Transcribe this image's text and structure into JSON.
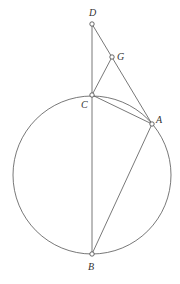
{
  "diagram": {
    "type": "geometry",
    "circle": {
      "cx": 92,
      "cy": 175,
      "r": 79
    },
    "points": [
      {
        "id": "D",
        "label": "D",
        "x": 92,
        "y": 24,
        "lx": 89,
        "ly": 16
      },
      {
        "id": "G",
        "label": "G",
        "x": 112,
        "y": 57,
        "lx": 117,
        "ly": 57
      },
      {
        "id": "C",
        "label": "C",
        "x": 92,
        "y": 95,
        "lx": 81,
        "ly": 107
      },
      {
        "id": "A",
        "label": "A",
        "x": 152,
        "y": 124,
        "lx": 156,
        "ly": 122
      },
      {
        "id": "B",
        "label": "B",
        "x": 92,
        "y": 254,
        "lx": 88,
        "ly": 269
      }
    ],
    "segments": [
      [
        "D",
        "B"
      ],
      [
        "D",
        "A"
      ],
      [
        "C",
        "G"
      ],
      [
        "C",
        "A"
      ],
      [
        "A",
        "B"
      ]
    ],
    "arcs": [
      "arc C-A inside circle (chord and arc)"
    ]
  }
}
